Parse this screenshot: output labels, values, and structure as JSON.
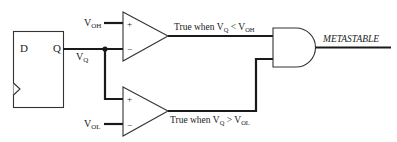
{
  "diagram": {
    "type": "metastability-detector-circuit",
    "flipflop": {
      "d_label": "D",
      "q_label": "Q",
      "clock": "clock-triangle"
    },
    "signals": {
      "vq": {
        "main": "V",
        "sub": "Q"
      },
      "voh": {
        "main": "V",
        "sub": "OH"
      },
      "vol": {
        "main": "V",
        "sub": "OL"
      }
    },
    "comparators": [
      {
        "plus_label": "+",
        "minus_label": "−",
        "output_label": {
          "prefix": "True when V",
          "sub1": "Q",
          "op": " < V",
          "sub2": "OH"
        }
      },
      {
        "plus_label": "+",
        "minus_label": "−",
        "output_label": {
          "prefix": "True when V",
          "sub1": "Q",
          "op": " > V",
          "sub2": "OL"
        }
      }
    ],
    "gate": {
      "type": "AND"
    },
    "output": {
      "label": "METASTABLE"
    },
    "colors": {
      "line": "#1a1a1a",
      "background": "#ffffff"
    }
  }
}
